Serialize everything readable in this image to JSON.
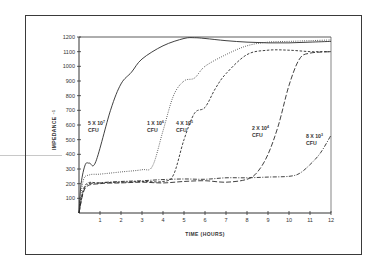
{
  "chart_data": {
    "type": "line",
    "title": "",
    "xlabel": "TIME (HOURS)",
    "ylabel": "IMPEDANCE ⁻¹",
    "xlim": [
      0,
      12
    ],
    "ylim": [
      0,
      1200
    ],
    "xticks": [
      1,
      2,
      3,
      4,
      5,
      6,
      7,
      8,
      9,
      10,
      11,
      12
    ],
    "yticks": [
      100,
      200,
      300,
      400,
      500,
      600,
      700,
      800,
      900,
      1000,
      1100,
      1200
    ],
    "grid": false,
    "legend": "inline labels",
    "series": [
      {
        "name": "5 X 10⁷ CFU",
        "style": "solid",
        "label_pos": [
          0.5,
          580
        ],
        "x": [
          0,
          0.1,
          0.3,
          0.5,
          0.8,
          1.5,
          2,
          2.5,
          3,
          4,
          5,
          5.5,
          6,
          7,
          8,
          9,
          10,
          11,
          12
        ],
        "values": [
          0,
          200,
          330,
          340,
          350,
          700,
          880,
          960,
          1050,
          1140,
          1190,
          1195,
          1190,
          1175,
          1165,
          1160,
          1160,
          1165,
          1170
        ]
      },
      {
        "name": "1 X 10⁶ CFU",
        "style": "dotted",
        "label_pos": [
          3.2,
          580
        ],
        "x": [
          0,
          0.2,
          0.5,
          1,
          2,
          3,
          3.5,
          4,
          4.5,
          5,
          5.5,
          6,
          7,
          8,
          9,
          10,
          11,
          12
        ],
        "values": [
          0,
          220,
          260,
          265,
          280,
          295,
          320,
          560,
          800,
          900,
          920,
          1000,
          1080,
          1140,
          1165,
          1170,
          1175,
          1180
        ]
      },
      {
        "name": "4 X 10⁵ CFU",
        "style": "dashed",
        "label_pos": [
          4.6,
          580
        ],
        "x": [
          0,
          0.3,
          1,
          2,
          3,
          4,
          4.5,
          5,
          5.5,
          6,
          6.5,
          7,
          8,
          9,
          10,
          11,
          11.5,
          12
        ],
        "values": [
          0,
          190,
          205,
          210,
          215,
          215,
          260,
          500,
          680,
          720,
          850,
          950,
          1080,
          1110,
          1110,
          1100,
          1100,
          1100
        ]
      },
      {
        "name": "2 X 10⁴ CFU",
        "style": "long-dashed",
        "label_pos": [
          8.3,
          580
        ],
        "x": [
          0,
          0.3,
          1,
          2,
          3,
          4,
          5,
          6,
          7,
          8,
          8.5,
          9,
          9.5,
          10,
          10.5,
          11,
          12
        ],
        "values": [
          0,
          170,
          200,
          205,
          210,
          205,
          215,
          220,
          210,
          230,
          280,
          400,
          600,
          870,
          1050,
          1090,
          1100
        ]
      },
      {
        "name": "8 X 10³ CFU",
        "style": "dash-dot",
        "label_pos": [
          10.9,
          500
        ],
        "x": [
          0,
          0.3,
          1,
          2,
          3,
          4,
          5,
          6,
          7,
          8,
          9,
          10,
          10.5,
          11,
          11.5,
          12
        ],
        "values": [
          0,
          180,
          205,
          215,
          220,
          228,
          232,
          230,
          240,
          240,
          245,
          250,
          270,
          330,
          410,
          530
        ]
      }
    ]
  },
  "labels": {
    "s1_line1": "5 X 10",
    "s1_exp": "7",
    "s2_line1": "1 X 10",
    "s2_exp": "6",
    "s3_line1": "4 X 10",
    "s3_exp": "5",
    "s4_line1": "2 X 10",
    "s4_exp": "4",
    "s5_line1": "8 X 10",
    "s5_exp": "3",
    "unit": "CFU",
    "ylabel": "IMPEDANCE",
    "ylabel_exp": "−1",
    "xlabel": "TIME (HOURS)"
  }
}
